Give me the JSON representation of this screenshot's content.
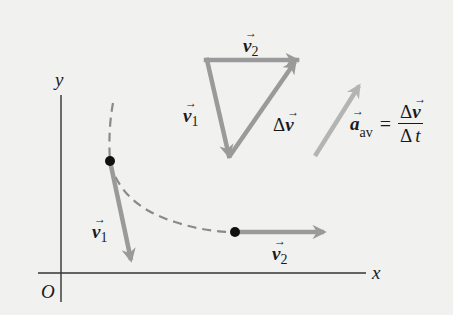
{
  "colors": {
    "background": "#f1f1f0",
    "axis": "#333333",
    "velocity_vector": "#9a9a9a",
    "acceleration_vector": "#b4b4b4",
    "path": "#8a8a8a",
    "point": "#111111",
    "text": "#1a1a1a"
  },
  "axes": {
    "x_label": "x",
    "y_label": "y",
    "origin_label": "O"
  },
  "path": {
    "style": "dashed",
    "points": [
      {
        "name": "P1",
        "x": 110,
        "y": 161
      },
      {
        "name": "P2",
        "x": 235,
        "y": 232
      }
    ]
  },
  "vectors": {
    "v1_at_p1": {
      "symbol": "v",
      "subscript": "1",
      "arrow": "→"
    },
    "v2_at_p2": {
      "symbol": "v",
      "subscript": "2",
      "arrow": "→"
    },
    "triangle_v1": {
      "symbol": "v",
      "subscript": "1",
      "arrow": "→"
    },
    "triangle_v2": {
      "symbol": "v",
      "subscript": "2",
      "arrow": "→"
    },
    "delta_v": {
      "delta": "Δ",
      "symbol": "v",
      "arrow": "→"
    }
  },
  "equation": {
    "lhs_symbol": "a",
    "lhs_arrow": "→",
    "lhs_subscript": "av",
    "equals": "=",
    "numerator_delta": "Δ",
    "numerator_symbol": "v",
    "numerator_arrow": "→",
    "denominator_delta": "Δ",
    "denominator_symbol": "t"
  }
}
